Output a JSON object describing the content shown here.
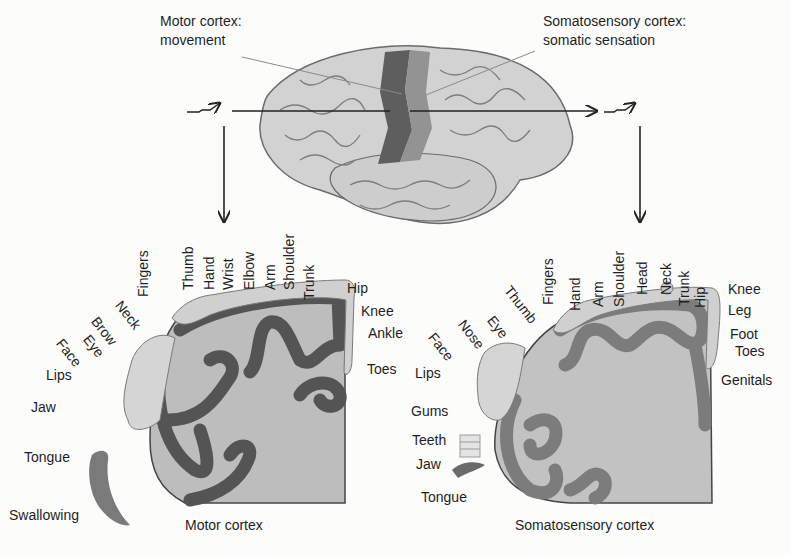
{
  "top": {
    "motor_callout": {
      "line1": "Motor cortex:",
      "line2": "movement"
    },
    "sensory_callout": {
      "line1": "Somatosensory cortex:",
      "line2": "somatic sensation"
    }
  },
  "motor": {
    "caption": "Motor cortex",
    "vertical_labels": [
      "Fingers",
      "Thumb",
      "Hand",
      "Wrist",
      "Elbow",
      "Arm",
      "Shoulder",
      "Trunk"
    ],
    "diagonal_labels": [
      "Neck",
      "Brow",
      "Eye",
      "Face"
    ],
    "side_labels": [
      "Hip",
      "Knee",
      "Ankle",
      "Toes"
    ],
    "left_labels": [
      "Lips",
      "Jaw",
      "Tongue",
      "Swallowing"
    ]
  },
  "sensory": {
    "caption": "Somatosensory cortex",
    "vertical_labels": [
      "Fingers",
      "Hand",
      "Arm",
      "Shoulder",
      "Head",
      "Neck",
      "Trunk",
      "Hip"
    ],
    "diagonal_labels": [
      "Thumb",
      "Eye",
      "Nose",
      "Face"
    ],
    "side_labels": [
      "Knee",
      "Leg",
      "Foot",
      "Toes",
      "Genitals"
    ],
    "left_labels": [
      "Lips",
      "Gums",
      "Teeth",
      "Jaw",
      "Tongue"
    ]
  },
  "colors": {
    "motor_strip": "#5a5a5a",
    "sensory_strip": "#8c8c8c",
    "cortex_fill": "#b9b9b9",
    "gyrus_dark": "#505050",
    "gyrus_mid": "#7a7a7a",
    "brain_fill": "#c8c8c8"
  }
}
